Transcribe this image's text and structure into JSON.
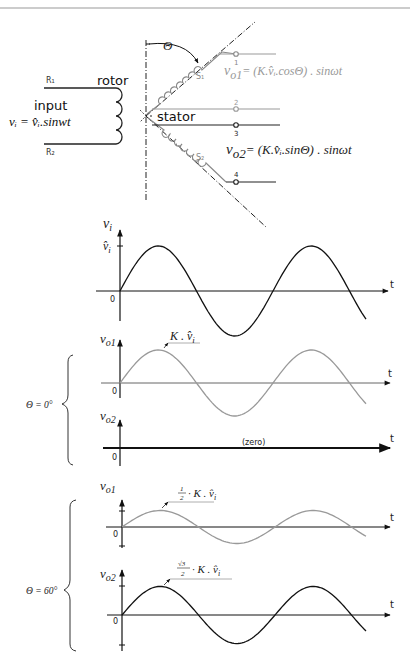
{
  "header": {
    "caption_fragment": ""
  },
  "schematic": {
    "rotor_label": "rotor",
    "stator_label": "stator",
    "input_label": "input",
    "input_equation": "vᵢ = v̂ᵢ.sinwt",
    "terminal_r1": "R₁",
    "terminal_r2": "R₂",
    "winding_s1": "S₁",
    "winding_s2": "S₂",
    "angle_symbol": "Θ",
    "terminals": [
      "1",
      "2",
      "3",
      "4"
    ],
    "vo1_equation": "vo1 = (K.v̂ᵢ.cosΘ) . sinωt",
    "vo2_equation": "vo2 = (K.v̂ᵢ.sinΘ) . sinωt",
    "vo1_symbol": "v",
    "vo1_sub": "o1",
    "vo1_rhs": "= (K.v̂ᵢ.cosΘ) . sinωt",
    "vo2_symbol": "v",
    "vo2_sub": "o2",
    "vo2_rhs": "= (K.v̂ᵢ.sinΘ) . sinωt"
  },
  "groups": {
    "theta0_label": "Θ = 0°",
    "theta60_label": "Θ = 60°"
  },
  "chart_data": [
    {
      "type": "line",
      "title": "Input voltage",
      "ylabel": "vi",
      "xlabel": "t",
      "origin_label": "0",
      "peak_label": "v̂i",
      "amplitude_relative": 1.0,
      "periods_shown": 1.6,
      "waveform": "sin"
    },
    {
      "type": "line",
      "group": "Θ = 0°",
      "ylabel": "vo1",
      "xlabel": "t",
      "origin_label": "0",
      "peak_annotation": "K . v̂i",
      "amplitude_relative": 1.0,
      "waveform": "sin"
    },
    {
      "type": "line",
      "group": "Θ = 0°",
      "ylabel": "vo2",
      "xlabel": "t",
      "origin_label": "0",
      "annotation": "(zero)",
      "amplitude_relative": 0,
      "waveform": "zero"
    },
    {
      "type": "line",
      "group": "Θ = 60°",
      "ylabel": "vo1",
      "xlabel": "t",
      "origin_label": "0",
      "peak_annotation": "½ · K . v̂i",
      "amplitude_relative": 0.5,
      "waveform": "sin"
    },
    {
      "type": "line",
      "group": "Θ = 60°",
      "ylabel": "vo2",
      "xlabel": "t",
      "origin_label": "0",
      "peak_annotation": "√3/2 · K . v̂i",
      "amplitude_relative": 0.866,
      "waveform": "sin"
    }
  ],
  "plots": {
    "p1": {
      "y": "v",
      "ysub": "i",
      "t": "t",
      "zero": "0",
      "peak": "v̂",
      "peaksub": "i"
    },
    "p2": {
      "y": "v",
      "ysub": "o1",
      "t": "t",
      "zero": "0",
      "ann": "K . v̂",
      "annsub": "i"
    },
    "p3": {
      "y": "v",
      "ysub": "o2",
      "t": "t",
      "zero": "0",
      "ann": "(zero)"
    },
    "p4": {
      "y": "v",
      "ysub": "o1",
      "t": "t",
      "zero": "0",
      "ann_num": "1",
      "ann_den": "2",
      "ann_rest": "· K . v̂",
      "annsub": "i"
    },
    "p5": {
      "y": "v",
      "ysub": "o2",
      "t": "t",
      "zero": "0",
      "ann_num": "√3",
      "ann_den": "2",
      "ann_rest": "· K . v̂",
      "annsub": "i"
    }
  },
  "colors": {
    "ink": "#111111",
    "grey": "#8a8a8a",
    "lightgrey": "#b0b0b0"
  }
}
